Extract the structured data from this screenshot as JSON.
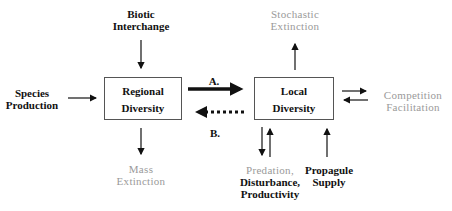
{
  "diagram": {
    "nodes": {
      "regional": {
        "line1": "Regional",
        "line2": "Diversity"
      },
      "local": {
        "line1": "Local",
        "line2": "Diversity"
      }
    },
    "inputs": {
      "biotic": {
        "line1": "Biotic",
        "line2": "Interchange"
      },
      "species": {
        "line1": "Species",
        "line2": "Production"
      },
      "mass": {
        "line1": "Mass",
        "line2": "Extinction"
      },
      "stochastic": {
        "line1": "Stochastic",
        "line2": "Extinction"
      },
      "competition": {
        "line1": "Competition",
        "line2": "Facilitation"
      },
      "predation": {
        "line1": "Predation,",
        "line2": "Disturbance,",
        "line3": "Productivity"
      },
      "propagule": {
        "line1": "Propagule",
        "line2": "Supply"
      }
    },
    "edge_labels": {
      "a": "A.",
      "b": "B."
    },
    "colors": {
      "dark": "#111111",
      "gray": "#9a9a9a",
      "box_border": "#555555"
    }
  }
}
